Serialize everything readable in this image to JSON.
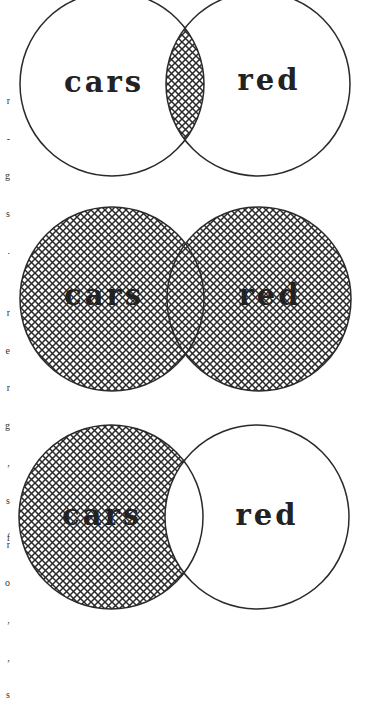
{
  "figure": {
    "type": "venn-diagram-series",
    "stroke_color": "#2a2a2a",
    "hatch_color": "#2a2a2a",
    "background": "#ffffff",
    "diagrams": [
      {
        "id": "and",
        "shaded_region": "intersection",
        "left_label": "cars",
        "right_label": "red",
        "left_circle": {
          "cx": 112,
          "cy": 84,
          "r": 92
        },
        "right_circle": {
          "cx": 258,
          "cy": 84,
          "r": 92
        },
        "label_baseline_y": 92
      },
      {
        "id": "or",
        "shaded_region": "union",
        "left_label": "cars",
        "right_label": "red",
        "left_circle": {
          "cx": 112,
          "cy": 299,
          "r": 92
        },
        "right_circle": {
          "cx": 259,
          "cy": 299,
          "r": 92
        },
        "label_baseline_y": 305
      },
      {
        "id": "not",
        "shaded_region": "left-only",
        "left_label": "cars",
        "right_label": "red",
        "left_circle": {
          "cx": 111,
          "cy": 517,
          "r": 92
        },
        "right_circle": {
          "cx": 257,
          "cy": 517,
          "r": 92
        },
        "label_baseline_y": 525
      }
    ]
  },
  "margin_text": {
    "block1": [
      "r",
      "-",
      "g",
      "s",
      "."
    ],
    "block2": [
      "r",
      "e",
      "r",
      "g",
      "‚",
      "s",
      "f"
    ],
    "block3": [
      "r",
      "o",
      "‚",
      "‚",
      "s"
    ]
  }
}
